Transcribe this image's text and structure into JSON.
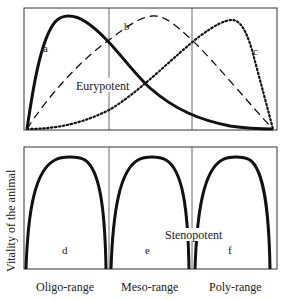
{
  "diagram": {
    "y_axis_label": "Vitality of the animal",
    "top_panel": {
      "annotation": "Eurypotent",
      "curves": [
        {
          "id": "a",
          "label": "a",
          "style": "solid-thick",
          "description": "peak in oligo-range"
        },
        {
          "id": "b",
          "label": "b",
          "style": "dashed",
          "description": "peak in meso-range"
        },
        {
          "id": "c",
          "label": "c",
          "style": "dotted",
          "description": "peak in poly-range"
        }
      ]
    },
    "bottom_panel": {
      "annotation": "Stenopotent",
      "curves": [
        {
          "id": "d",
          "label": "d",
          "style": "solid-thick",
          "range": "Oligo-range"
        },
        {
          "id": "e",
          "label": "e",
          "style": "solid-thick",
          "range": "Meso-range"
        },
        {
          "id": "f",
          "label": "f",
          "style": "solid-thick",
          "range": "Poly-range"
        }
      ]
    },
    "x_ranges": [
      "Oligo-range",
      "Meso-range",
      "Poly-range"
    ]
  }
}
